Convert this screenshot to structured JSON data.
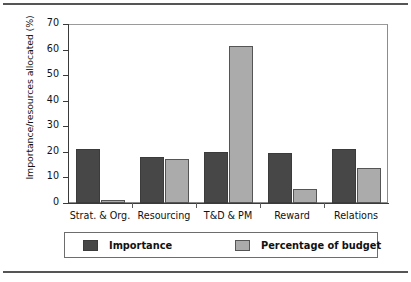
{
  "chart_data": {
    "type": "bar",
    "title": "",
    "xlabel": "",
    "ylabel": "Importance/resources allocated (%)",
    "categories": [
      "Strat. & Org.",
      "Resourcing",
      "T&D & PM",
      "Reward",
      "Relations"
    ],
    "series": [
      {
        "name": "Importance",
        "color": "#474747",
        "values": [
          21,
          18,
          20,
          19.5,
          21
        ]
      },
      {
        "name": "Percentage of budget",
        "color": "#ababab",
        "values": [
          1,
          17.3,
          61.5,
          5.5,
          13.5
        ]
      }
    ],
    "ylim": [
      0,
      70
    ],
    "yticks": [
      0,
      10,
      20,
      30,
      40,
      50,
      60,
      70
    ],
    "ytick_labels": [
      "0",
      "10",
      "20",
      "30",
      "40",
      "50",
      "60",
      "70"
    ],
    "grid": false,
    "legend_position": "bottom"
  },
  "legend": {
    "entries": [
      {
        "label": "Importance"
      },
      {
        "label": "Percentage of budget"
      }
    ]
  }
}
